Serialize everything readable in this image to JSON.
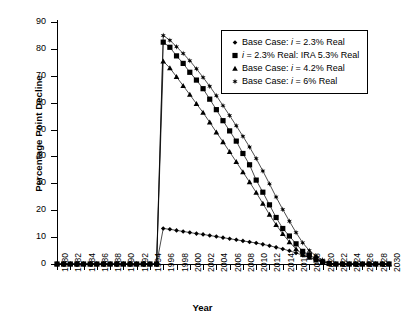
{
  "chart_data": {
    "type": "line",
    "title": "",
    "xlabel": "Year",
    "ylabel": "Percentage Point Decline",
    "xlim": [
      1980,
      2030
    ],
    "ylim": [
      0,
      90
    ],
    "yticks": [
      0,
      10,
      20,
      30,
      40,
      50,
      60,
      70,
      80,
      90
    ],
    "xticks": [
      1980,
      1982,
      1984,
      1986,
      1988,
      1990,
      1992,
      1994,
      1996,
      1998,
      2000,
      2002,
      2004,
      2006,
      2008,
      2010,
      2012,
      2014,
      2016,
      2018,
      2020,
      2022,
      2024,
      2026,
      2028,
      2030
    ],
    "xtick_labels": [
      "1980",
      "1982",
      "1984",
      "1986",
      "1988",
      "1990",
      "1992",
      "1994",
      "1996",
      "1998",
      "2000",
      "2002",
      "2004",
      "2006",
      "2008",
      "2010",
      "2012",
      "2014",
      "2016",
      "2018",
      "2020",
      "2022",
      "2024",
      "2026",
      "2028",
      "2030"
    ],
    "ytick_labels": [
      "0",
      "10",
      "20",
      "30",
      "40",
      "50",
      "60",
      "70",
      "80",
      "90"
    ],
    "grid": false,
    "legend_position": "upper right",
    "x": [
      1980,
      1981,
      1982,
      1983,
      1984,
      1985,
      1986,
      1987,
      1988,
      1989,
      1990,
      1991,
      1992,
      1993,
      1994,
      1995,
      1996,
      1997,
      1998,
      1999,
      2000,
      2001,
      2002,
      2003,
      2004,
      2005,
      2006,
      2007,
      2008,
      2009,
      2010,
      2011,
      2012,
      2013,
      2014,
      2015,
      2016,
      2017,
      2018,
      2019,
      2020,
      2021,
      2022,
      2023,
      2024,
      2025,
      2026,
      2027,
      2028,
      2029,
      2030
    ],
    "series": [
      {
        "name": "Base Case: i = 2.3% Real",
        "marker": "diamond",
        "values": [
          0,
          0,
          0,
          0,
          0,
          0,
          0,
          0,
          0,
          0,
          0,
          0,
          0,
          0,
          0,
          0,
          13.2,
          12.9,
          12.5,
          12.1,
          11.7,
          11.3,
          11.0,
          10.6,
          10.2,
          9.8,
          9.4,
          9.0,
          8.6,
          8.2,
          7.8,
          7.3,
          6.8,
          6.2,
          5.6,
          4.9,
          4.1,
          3.3,
          2.5,
          1.7,
          0.9,
          0.3,
          0,
          0,
          0,
          0,
          0,
          0,
          0,
          0,
          0
        ]
      },
      {
        "name": "i = 2.3% Real: IRA 5.3% Real",
        "marker": "square",
        "values": [
          0,
          0,
          0,
          0,
          0,
          0,
          0,
          0,
          0,
          0,
          0,
          0,
          0,
          0,
          0,
          0,
          82.5,
          80.6,
          77.4,
          74.6,
          71.3,
          68.4,
          65.2,
          61.3,
          57.4,
          53.3,
          49.5,
          45.7,
          41.1,
          36.9,
          31.2,
          26.7,
          22.0,
          17.3,
          13.2,
          10.4,
          7.5,
          4.7,
          3.4,
          1.9,
          0.8,
          0.2,
          0,
          0,
          0,
          0,
          0,
          0,
          0,
          0,
          0
        ]
      },
      {
        "name": "Base Case: i = 4.2% Real",
        "marker": "triangle",
        "values": [
          0,
          0,
          0,
          0,
          0,
          0,
          0,
          0,
          0,
          0,
          0,
          0,
          0,
          0,
          0,
          0,
          75.4,
          72.9,
          69.6,
          66.3,
          63.0,
          59.6,
          56.3,
          52.7,
          49.0,
          45.4,
          41.7,
          38.0,
          34.2,
          30.5,
          26.6,
          22.5,
          18.4,
          14.6,
          11.2,
          8.2,
          5.6,
          3.5,
          2.4,
          1.4,
          0.6,
          0.2,
          0,
          0,
          0,
          0,
          0,
          0,
          0,
          0,
          0
        ]
      },
      {
        "name": "Base Case: i = 6% Real",
        "marker": "star",
        "values": [
          0,
          0,
          0,
          0,
          0,
          0,
          0,
          0,
          0,
          0,
          0,
          0,
          0,
          0,
          0,
          0,
          85.0,
          83.2,
          80.8,
          78.3,
          75.6,
          72.6,
          69.4,
          66.1,
          62.6,
          58.9,
          55.2,
          51.4,
          47.5,
          43.5,
          39.2,
          34.6,
          29.8,
          24.9,
          20.3,
          15.9,
          11.7,
          7.9,
          5.0,
          3.0,
          1.5,
          0.4,
          0,
          0,
          0,
          0,
          0,
          0,
          0,
          0,
          0
        ]
      }
    ]
  },
  "legend": {
    "items": [
      {
        "prefix": "Base Case: ",
        "var": "i",
        "suffix": " = 2.3% Real",
        "marker": "diamond"
      },
      {
        "prefix": "",
        "var": "i",
        "suffix": " = 2.3% Real: IRA 5.3% Real",
        "marker": "square"
      },
      {
        "prefix": "Base Case: ",
        "var": "i",
        "suffix": " = 4.2% Real",
        "marker": "triangle"
      },
      {
        "prefix": "Base Case: ",
        "var": "i",
        "suffix": " = 6% Real",
        "marker": "star"
      }
    ]
  }
}
